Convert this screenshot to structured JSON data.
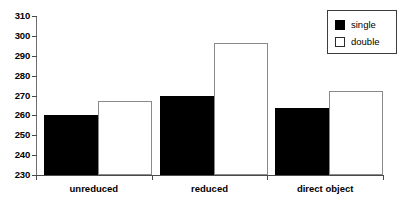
{
  "chart_data": {
    "type": "bar",
    "title": "",
    "subtitle": "",
    "xlabel": "",
    "ylabel": "",
    "categories": [
      "unreduced",
      "reduced",
      "direct object"
    ],
    "series": [
      {
        "name": "single",
        "values": [
          260,
          270,
          263.5
        ],
        "color": "#000000"
      },
      {
        "name": "double",
        "values": [
          267,
          296.5,
          272.5
        ],
        "color": "#ffffff"
      }
    ],
    "ylim": [
      230,
      310
    ],
    "ytick_step": 10,
    "yticks": [
      310,
      300,
      290,
      280,
      270,
      260,
      250,
      240,
      230
    ],
    "ytick_labels": [
      "310",
      "300",
      "290",
      "280",
      "270",
      "260",
      "250",
      "240",
      "230"
    ],
    "grid": false,
    "legend_position": "top-right",
    "annotations": []
  },
  "legend": {
    "entries": [
      {
        "label": "single",
        "swatch": "filled-black-square"
      },
      {
        "label": "double",
        "swatch": "open-white-square"
      }
    ]
  },
  "colors": {
    "background": "#ffffff",
    "axis": "#4a4a4a",
    "bar_single": "#000000",
    "bar_double_fill": "#ffffff",
    "bar_double_stroke": "#8a8a8a",
    "text": "#000000"
  }
}
